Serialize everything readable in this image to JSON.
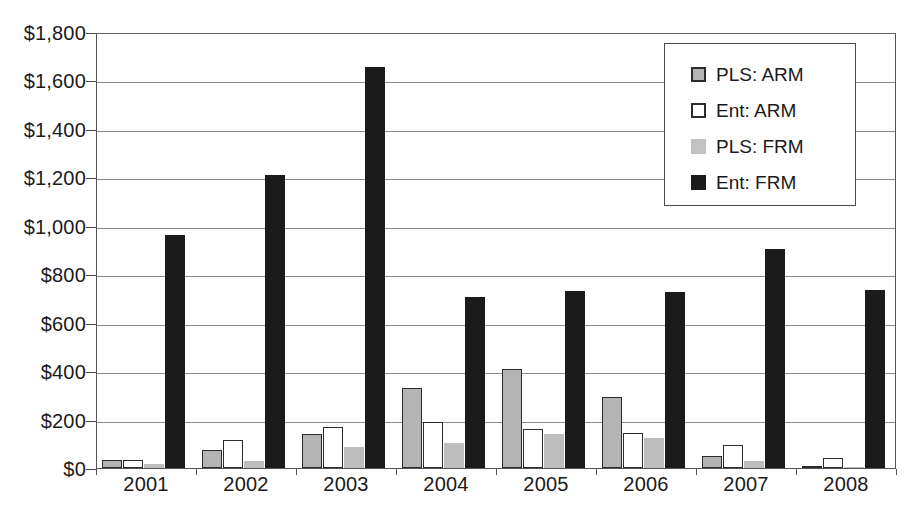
{
  "chart_data": {
    "type": "bar",
    "title": "",
    "subtitle": "",
    "xlabel": "",
    "ylabel": "",
    "categories": [
      "2001",
      "2002",
      "2003",
      "2004",
      "2005",
      "2006",
      "2007",
      "2008"
    ],
    "series": [
      {
        "name": "PLS: ARM",
        "color": "#b4b4b4",
        "values": [
          33,
          75,
          140,
          330,
          410,
          295,
          50,
          8
        ]
      },
      {
        "name": "Ent: ARM",
        "color": "#ffffff",
        "values": [
          33,
          115,
          170,
          190,
          160,
          145,
          95,
          40
        ]
      },
      {
        "name": "PLS: FRM",
        "color": "#bdbdbd",
        "values": [
          18,
          30,
          85,
          105,
          140,
          125,
          28,
          3
        ]
      },
      {
        "name": "Ent: FRM",
        "color": "#1b1b1b",
        "values": [
          960,
          1210,
          1655,
          705,
          730,
          725,
          905,
          735
        ]
      }
    ],
    "ylim": [
      0,
      1800
    ],
    "ytick_values": [
      0,
      200,
      400,
      600,
      800,
      1000,
      1200,
      1400,
      1600,
      1800
    ],
    "ytick_labels": [
      "$0",
      "$200",
      "$400",
      "$600",
      "$800",
      "$1,000",
      "$1,200",
      "$1,400",
      "$1,600",
      "$1,800"
    ],
    "grid": true,
    "legend_position": "top-right",
    "legend_entries": [
      "PLS: ARM",
      "Ent: ARM",
      "PLS: FRM",
      "Ent: FRM"
    ]
  }
}
